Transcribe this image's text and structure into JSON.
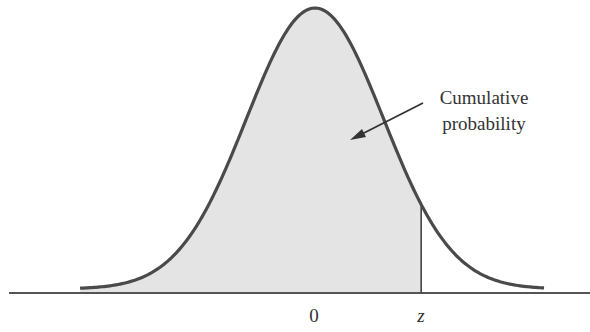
{
  "chart_data": {
    "type": "area",
    "title": "",
    "distribution": {
      "mean": 0,
      "sd": 1
    },
    "x_tick_labels": [
      "0",
      "z"
    ],
    "x_tick_positions": [
      0,
      1.55
    ],
    "shaded_region": {
      "from": "-inf",
      "to": "z"
    },
    "annotation": {
      "text_line1": "Cumulative",
      "text_line2": "probability",
      "arrow": true
    },
    "xlabel": "",
    "ylabel": "",
    "grid": false,
    "legend": false,
    "x_range": [
      -3.43,
      3.35
    ]
  },
  "labels": {
    "zero": "0",
    "z": "z",
    "annotation_line1": "Cumulative",
    "annotation_line2": "probability"
  },
  "colors": {
    "curve": "#4a4a4a",
    "fill": "#e4e4e4",
    "axis": "#555555",
    "text": "#333333"
  }
}
